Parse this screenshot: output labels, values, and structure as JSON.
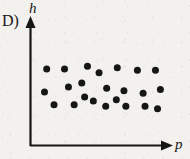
{
  "figure": {
    "option_letter": "D)",
    "background_color": "#f3f1ee",
    "ink_color": "#161616"
  },
  "chart_data": {
    "type": "scatter",
    "title": "",
    "subtitle": "",
    "xlabel": "p",
    "ylabel": "h",
    "grid": false,
    "legend": null,
    "axes": {
      "x_axis": {
        "label": "p",
        "arrow": true,
        "ticks": [],
        "tick_labels": []
      },
      "y_axis": {
        "label": "h",
        "arrow": true,
        "ticks": [],
        "tick_labels": []
      },
      "xlim": [
        0,
        1
      ],
      "ylim": [
        0,
        1
      ]
    },
    "annotation": "No correlation: points scattered in a flat horizontal band, h independent of p",
    "marker": {
      "shape": "circle",
      "filled": true,
      "color": "#161616",
      "size_px": 7
    },
    "point_count": 23,
    "points": [
      {
        "x": 0.108,
        "y": 0.612
      },
      {
        "x": 0.239,
        "y": 0.612
      },
      {
        "x": 0.408,
        "y": 0.633
      },
      {
        "x": 0.493,
        "y": 0.582
      },
      {
        "x": 0.627,
        "y": 0.622
      },
      {
        "x": 0.775,
        "y": 0.602
      },
      {
        "x": 0.908,
        "y": 0.602
      },
      {
        "x": 0.092,
        "y": 0.429
      },
      {
        "x": 0.268,
        "y": 0.469
      },
      {
        "x": 0.366,
        "y": 0.5
      },
      {
        "x": 0.549,
        "y": 0.459
      },
      {
        "x": 0.676,
        "y": 0.439
      },
      {
        "x": 0.817,
        "y": 0.418
      },
      {
        "x": 0.944,
        "y": 0.449
      },
      {
        "x": 0.162,
        "y": 0.327
      },
      {
        "x": 0.31,
        "y": 0.327
      },
      {
        "x": 0.451,
        "y": 0.357
      },
      {
        "x": 0.542,
        "y": 0.316
      },
      {
        "x": 0.69,
        "y": 0.316
      },
      {
        "x": 0.831,
        "y": 0.316
      },
      {
        "x": 0.923,
        "y": 0.296
      },
      {
        "x": 0.387,
        "y": 0.388
      },
      {
        "x": 0.62,
        "y": 0.367
      }
    ]
  }
}
